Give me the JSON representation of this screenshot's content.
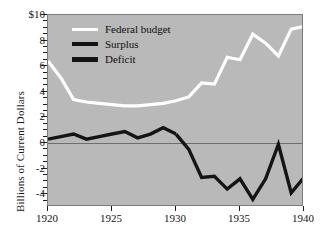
{
  "chart_data": {
    "type": "line",
    "title": "",
    "subtitle": "",
    "xlabel": "",
    "ylabel": "Billions of Current Dollars",
    "xlim": [
      1920,
      1940
    ],
    "ylim": [
      -5,
      10
    ],
    "xticks": [
      1920,
      1925,
      1930,
      1935,
      1940
    ],
    "xtick_labels": [
      "1920",
      "1925",
      "1930",
      "1935",
      "1940"
    ],
    "yticks": [
      -4,
      -2,
      0,
      2,
      4,
      6,
      8,
      10
    ],
    "ytick_labels": [
      "-4",
      "-2",
      "0",
      "2",
      "4",
      "6",
      "8",
      "$10"
    ],
    "yminor_step": 0.5,
    "grid": false,
    "zero_line": true,
    "plot_background": "#b9b9b9",
    "legend_position": "top-left",
    "legend": [
      {
        "label": "Federal budget",
        "color": "#ffffff"
      },
      {
        "label": "Surplus",
        "color": "#141414"
      },
      {
        "label": "Deficit",
        "color": "#141414"
      }
    ],
    "x": [
      1920,
      1921,
      1922,
      1923,
      1924,
      1925,
      1926,
      1927,
      1928,
      1929,
      1930,
      1931,
      1932,
      1933,
      1934,
      1935,
      1936,
      1937,
      1938,
      1939,
      1940
    ],
    "series": [
      {
        "name": "Federal budget",
        "color": "#ffffff",
        "values": [
          6.4,
          5.1,
          3.4,
          3.2,
          3.1,
          3.0,
          2.9,
          2.9,
          3.0,
          3.1,
          3.3,
          3.6,
          4.7,
          4.6,
          6.7,
          6.5,
          8.5,
          7.8,
          6.8,
          8.9,
          9.1
        ]
      },
      {
        "name": "Surplus",
        "color": "#141414",
        "values": [
          0.3,
          0.5,
          0.7,
          0.3,
          0.5,
          0.7,
          0.9,
          0.4,
          0.7,
          1.2,
          0.7,
          null,
          null,
          null,
          null,
          null,
          null,
          null,
          null,
          null,
          null
        ]
      },
      {
        "name": "Deficit",
        "color": "#141414",
        "values": [
          null,
          null,
          null,
          null,
          null,
          null,
          null,
          null,
          null,
          null,
          0.7,
          -0.5,
          -2.7,
          -2.6,
          -3.6,
          -2.8,
          -4.4,
          -2.8,
          -0.1,
          -3.9,
          -2.7
        ]
      }
    ]
  },
  "axis": {
    "ylabel": "Billions of Current Dollars"
  }
}
